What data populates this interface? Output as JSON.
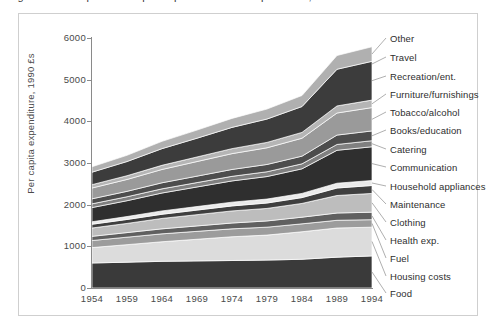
{
  "caption": {
    "text": "Figure 2.3 Composition of per capita consumer expenditure, 1954–1994"
  },
  "chart_data": {
    "type": "area",
    "stacked": true,
    "title": "",
    "xlabel": "",
    "ylabel": "Per capita expenditure, 1990 £s",
    "x": [
      1954,
      1959,
      1964,
      1969,
      1974,
      1979,
      1984,
      1989,
      1994
    ],
    "xtick_labels": [
      "1954",
      "1959",
      "1964",
      "1969",
      "1974",
      "1979",
      "1984",
      "1989",
      "1994"
    ],
    "ylim": [
      0,
      6000
    ],
    "ytick_labels": [
      "0",
      "1000",
      "2000",
      "3000",
      "4000",
      "5000",
      "6000"
    ],
    "yticks": [
      0,
      1000,
      2000,
      3000,
      4000,
      5000,
      6000
    ],
    "grid": false,
    "legend_position": "right-outside",
    "series": [
      {
        "name": "Food",
        "color": "#3a3a3a",
        "values": [
          600,
          620,
          640,
          650,
          660,
          670,
          690,
          740,
          770
        ]
      },
      {
        "name": "Housing costs",
        "color": "#dcdcdc",
        "values": [
          370,
          420,
          470,
          520,
          570,
          600,
          660,
          700,
          690
        ]
      },
      {
        "name": "Fuel",
        "color": "#9c9c9c",
        "values": [
          170,
          180,
          190,
          190,
          190,
          190,
          190,
          185,
          180
        ]
      },
      {
        "name": "Health exp.",
        "color": "#606060",
        "values": [
          100,
          110,
          120,
          130,
          140,
          150,
          160,
          175,
          180
        ]
      },
      {
        "name": "Clothing",
        "color": "#bdbdbd",
        "values": [
          200,
          220,
          250,
          270,
          290,
          300,
          330,
          420,
          450
        ]
      },
      {
        "name": "Maintenance",
        "color": "#3f3f3f",
        "values": [
          90,
          95,
          100,
          110,
          120,
          130,
          140,
          180,
          190
        ]
      },
      {
        "name": "Household appliances",
        "color": "#eaeaea",
        "values": [
          60,
          70,
          80,
          85,
          90,
          95,
          100,
          115,
          120
        ]
      },
      {
        "name": "Communication",
        "color": "#2f2f2f",
        "values": [
          340,
          380,
          430,
          470,
          510,
          540,
          590,
          790,
          810
        ]
      },
      {
        "name": "Catering",
        "color": "#808080",
        "values": [
          90,
          95,
          100,
          105,
          110,
          115,
          120,
          140,
          145
        ]
      },
      {
        "name": "Books/education",
        "color": "#4d4d4d",
        "values": [
          120,
          130,
          145,
          155,
          165,
          175,
          185,
          225,
          235
        ]
      },
      {
        "name": "Tobacco/alcohol",
        "color": "#9a9a9a",
        "values": [
          260,
          285,
          320,
          350,
          380,
          400,
          430,
          530,
          560
        ]
      },
      {
        "name": "Furniture/furnishings",
        "color": "#b5b5b5",
        "values": [
          80,
          90,
          100,
          110,
          120,
          130,
          140,
          170,
          180
        ]
      },
      {
        "name": "Recreation/ent.",
        "color": "#3c3c3c",
        "values": [
          300,
          340,
          400,
          450,
          510,
          560,
          620,
          880,
          930
        ]
      },
      {
        "name": "Other",
        "color": "#b0b0b0",
        "values": [
          130,
          150,
          175,
          195,
          215,
          240,
          265,
          330,
          350
        ]
      }
    ]
  },
  "legend_labels": [
    "Other",
    "Travel",
    "Recreation/ent.",
    "Furniture/furnishings",
    "Tobacco/alcohol",
    "Books/education",
    "Catering",
    "Communication",
    "Household appliances",
    "Maintenance",
    "Clothing",
    "Health exp.",
    "Fuel",
    "Housing costs",
    "Food"
  ]
}
